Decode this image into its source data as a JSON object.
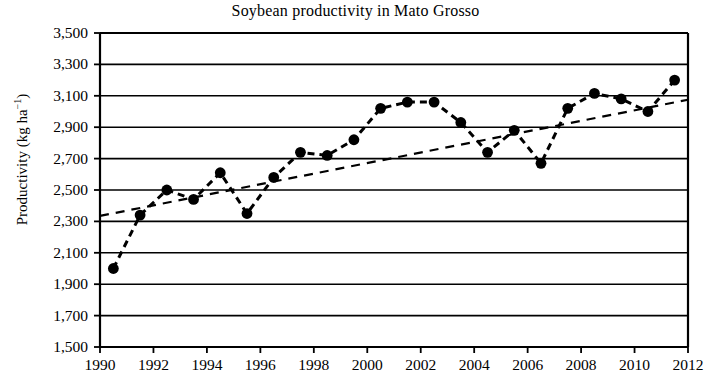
{
  "chart_data": {
    "type": "line",
    "title": "Soybean productivity in Mato Grosso",
    "xlabel": "",
    "ylabel": "Productivity (kg ha",
    "ylabel_sup": "−1",
    "ylabel_close": ")",
    "xlim": [
      1990,
      2012
    ],
    "ylim": [
      1500,
      3500
    ],
    "ytick_step": 200,
    "xtick_step": 2,
    "grid": true,
    "legend": "none",
    "yticks": [
      "3,500",
      "3,300",
      "3,100",
      "2,900",
      "2,700",
      "2,500",
      "2,300",
      "2,100",
      "1,900",
      "1,700",
      "1,500"
    ],
    "ytick_values": [
      3500,
      3300,
      3100,
      2900,
      2700,
      2500,
      2300,
      2100,
      1900,
      1700,
      1500
    ],
    "xticks": [
      "1990",
      "1992",
      "1994",
      "1996",
      "1998",
      "2000",
      "2002",
      "2004",
      "2006",
      "2008",
      "2010",
      "2012"
    ],
    "xtick_values": [
      1990,
      1992,
      1994,
      1996,
      1998,
      2000,
      2002,
      2004,
      2006,
      2008,
      2010,
      2012
    ],
    "series": [
      {
        "name": "Productivity",
        "style": "dashed-line-with-round-markers",
        "color": "#000000",
        "x": [
          1990.5,
          1991.5,
          1992.5,
          1993.5,
          1994.5,
          1995.5,
          1996.5,
          1997.5,
          1998.5,
          1999.5,
          2000.5,
          2001.5,
          2002.5,
          2003.5,
          2004.5,
          2005.5,
          2006.5,
          2007.5,
          2008.5,
          2009.5,
          2010.5,
          2011.5
        ],
        "values": [
          2000,
          2340,
          2500,
          2440,
          2610,
          2350,
          2580,
          2740,
          2720,
          2820,
          3020,
          3060,
          3060,
          2930,
          2740,
          2880,
          2670,
          3020,
          3115,
          3080,
          3000,
          3200
        ]
      },
      {
        "name": "Linear trend",
        "style": "dashed-line",
        "color": "#000000",
        "x": [
          1990,
          2012
        ],
        "values": [
          2335,
          3075
        ]
      }
    ]
  }
}
